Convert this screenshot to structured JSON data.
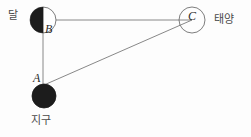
{
  "figure": {
    "background_color": "#fdfdfd",
    "line_color": "#6e6e6e",
    "body_fill_dark": "#1a1a1a",
    "body_stroke": "#555555"
  },
  "bodies": {
    "moon": {
      "korean_label": "달",
      "point_label": "B",
      "cx": 43,
      "cy": 20,
      "r": 13,
      "shading": "left-half-dark"
    },
    "earth": {
      "korean_label": "지구",
      "point_label": "A",
      "cx": 44,
      "cy": 96,
      "r": 12,
      "shading": "full-dark"
    },
    "sun": {
      "korean_label": "태양",
      "point_label": "C",
      "cx": 192,
      "cy": 20,
      "r": 13,
      "shading": "none"
    }
  },
  "lines": [
    {
      "name": "moon-to-sun",
      "from": "B",
      "to": "C",
      "x1": 43,
      "y1": 20,
      "x2": 192,
      "y2": 20
    },
    {
      "name": "moon-to-earth",
      "from": "B",
      "to": "A",
      "x1": 43,
      "y1": 20,
      "x2": 43,
      "y2": 85
    },
    {
      "name": "earth-to-sun",
      "from": "A",
      "to": "C",
      "x1": 44,
      "y1": 85,
      "x2": 192,
      "y2": 20
    }
  ],
  "points": {
    "a": "A",
    "b": "B",
    "c": "C"
  }
}
